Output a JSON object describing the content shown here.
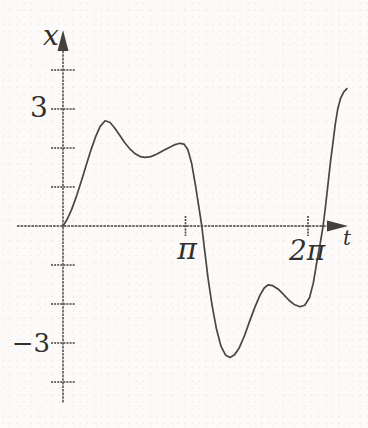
{
  "figure_description": "Hand-drawn style textbook graph of an oscillating solution curve x versus t",
  "colors": {
    "ink": "#45413c",
    "curve": "#4a4642",
    "paper": "#fcfbf9"
  },
  "chart_data": {
    "type": "line",
    "title": "",
    "xlabel": "t",
    "ylabel": "x",
    "xlim": [
      -1.2,
      7.5
    ],
    "ylim": [
      -4.7,
      5.0
    ],
    "grid": false,
    "legend": false,
    "x_ticks": [
      {
        "value": 3.14159,
        "label": "π"
      },
      {
        "value": 6.28319,
        "label": "2π"
      }
    ],
    "y_ticks": [
      {
        "value": 4,
        "label": ""
      },
      {
        "value": 3,
        "label": "3"
      },
      {
        "value": 2,
        "label": ""
      },
      {
        "value": 1,
        "label": ""
      },
      {
        "value": -1,
        "label": ""
      },
      {
        "value": -2,
        "label": ""
      },
      {
        "value": -3,
        "label": "−3"
      },
      {
        "value": -4,
        "label": ""
      }
    ],
    "key_points": {
      "start": [
        0,
        0
      ],
      "local_max_1": [
        1.08,
        2.7
      ],
      "local_min_1": [
        2.1,
        1.76
      ],
      "local_max_2": [
        3.08,
        2.12
      ],
      "zero_crossing_1": [
        3.56,
        0
      ],
      "global_min": [
        4.28,
        -3.37
      ],
      "local_max_3": [
        5.26,
        -1.51
      ],
      "local_min_2": [
        6.08,
        -2.07
      ],
      "zero_crossing_2": [
        6.67,
        0
      ],
      "end": [
        7.28,
        3.52
      ]
    },
    "series": [
      {
        "name": "x(t)",
        "points": [
          [
            0.0,
            0.0
          ],
          [
            0.1,
            0.16
          ],
          [
            0.22,
            0.42
          ],
          [
            0.35,
            0.78
          ],
          [
            0.48,
            1.18
          ],
          [
            0.6,
            1.58
          ],
          [
            0.72,
            1.96
          ],
          [
            0.84,
            2.3
          ],
          [
            0.95,
            2.55
          ],
          [
            1.08,
            2.7
          ],
          [
            1.2,
            2.66
          ],
          [
            1.32,
            2.52
          ],
          [
            1.45,
            2.33
          ],
          [
            1.58,
            2.14
          ],
          [
            1.72,
            1.97
          ],
          [
            1.85,
            1.85
          ],
          [
            1.98,
            1.78
          ],
          [
            2.1,
            1.76
          ],
          [
            2.25,
            1.78
          ],
          [
            2.4,
            1.84
          ],
          [
            2.55,
            1.92
          ],
          [
            2.7,
            2.0
          ],
          [
            2.85,
            2.08
          ],
          [
            3.0,
            2.12
          ],
          [
            3.1,
            2.1
          ],
          [
            3.2,
            1.96
          ],
          [
            3.3,
            1.6
          ],
          [
            3.4,
            1.02
          ],
          [
            3.5,
            0.38
          ],
          [
            3.56,
            0.0
          ],
          [
            3.63,
            -0.62
          ],
          [
            3.72,
            -1.35
          ],
          [
            3.82,
            -2.02
          ],
          [
            3.93,
            -2.62
          ],
          [
            4.05,
            -3.08
          ],
          [
            4.17,
            -3.31
          ],
          [
            4.28,
            -3.37
          ],
          [
            4.4,
            -3.3
          ],
          [
            4.52,
            -3.12
          ],
          [
            4.65,
            -2.82
          ],
          [
            4.78,
            -2.46
          ],
          [
            4.92,
            -2.08
          ],
          [
            5.05,
            -1.78
          ],
          [
            5.16,
            -1.59
          ],
          [
            5.26,
            -1.51
          ],
          [
            5.38,
            -1.53
          ],
          [
            5.52,
            -1.62
          ],
          [
            5.66,
            -1.76
          ],
          [
            5.8,
            -1.91
          ],
          [
            5.94,
            -2.02
          ],
          [
            6.08,
            -2.07
          ],
          [
            6.2,
            -2.03
          ],
          [
            6.32,
            -1.84
          ],
          [
            6.42,
            -1.45
          ],
          [
            6.52,
            -0.85
          ],
          [
            6.6,
            -0.42
          ],
          [
            6.67,
            0.0
          ],
          [
            6.73,
            0.5
          ],
          [
            6.8,
            1.12
          ],
          [
            6.86,
            1.65
          ],
          [
            6.92,
            2.12
          ],
          [
            6.98,
            2.6
          ],
          [
            7.05,
            3.02
          ],
          [
            7.12,
            3.28
          ],
          [
            7.2,
            3.44
          ],
          [
            7.28,
            3.52
          ]
        ]
      }
    ],
    "layout": {
      "origin_px": [
        63,
        226
      ],
      "px_per_unit": 39,
      "y_axis_px_range": [
        30,
        403
      ],
      "x_axis_px_range": [
        17,
        348
      ],
      "y_tick_half_len": 12,
      "x_tick_half_len": 10,
      "arrow_len": 21,
      "arrow_half_w": 5.5
    }
  }
}
